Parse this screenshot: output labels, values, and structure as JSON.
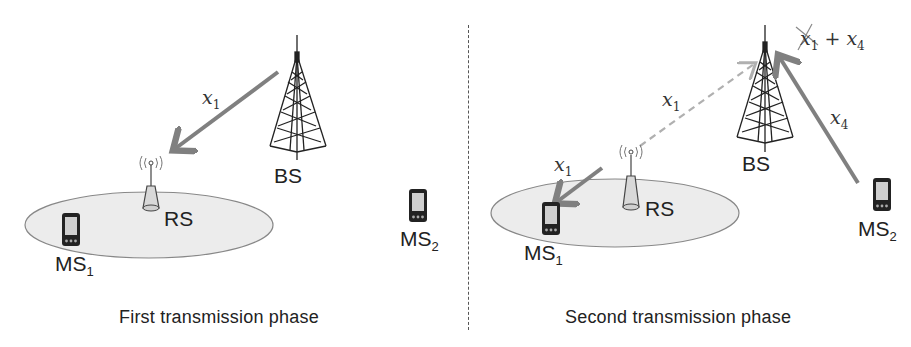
{
  "figure": {
    "divider": "dashed-vertical",
    "colors": {
      "arrow": "#808080",
      "dashed_arrow": "#b0b0b0",
      "coverage_fill": "#ececec",
      "coverage_stroke": "#888888",
      "tower": "#222222"
    },
    "phases": [
      {
        "caption": "First transmission phase",
        "nodes": {
          "bs": {
            "label": "BS"
          },
          "rs": {
            "label": "RS"
          },
          "ms1": {
            "label": "MS",
            "sub": "1"
          },
          "ms2": {
            "label": "MS",
            "sub": "2"
          }
        },
        "links": [
          {
            "from": "BS",
            "to": "RS",
            "signal": "x",
            "sub": "1",
            "style": "solid"
          }
        ]
      },
      {
        "caption": "Second transmission phase",
        "nodes": {
          "bs": {
            "label": "BS"
          },
          "rs": {
            "label": "RS"
          },
          "ms1": {
            "label": "MS",
            "sub": "1"
          },
          "ms2": {
            "label": "MS",
            "sub": "2"
          }
        },
        "links": [
          {
            "from": "RS",
            "to": "MS1",
            "signal": "x",
            "sub": "1",
            "style": "solid"
          },
          {
            "from": "RS",
            "to": "BS",
            "signal": "x",
            "sub": "1",
            "style": "dashed"
          },
          {
            "from": "MS2",
            "to": "BS",
            "signal": "x",
            "sub": "4",
            "style": "solid"
          }
        ],
        "received": {
          "cancelled_term": "x",
          "cancelled_sub": "1",
          "op": "+",
          "term": "x",
          "term_sub": "4"
        }
      }
    ]
  }
}
